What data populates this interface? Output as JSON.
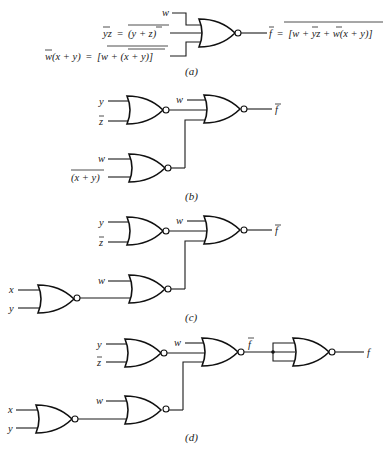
{
  "figure": {
    "panels": [
      {
        "id": "a",
        "caption": "(a)",
        "inputs": [
          {
            "label": "w"
          },
          {
            "label": "y̅z = (y + z̅)",
            "label_left": "yz",
            "label_eq": "=",
            "label_right": "(y + z)"
          },
          {
            "label": "w̅(x + y) = [w + (x + y)]",
            "label_left": "w(x + y)",
            "label_eq": "=",
            "label_right": "[w + (x + y)]"
          }
        ],
        "output": {
          "label": "f̅ = [w + y̅z + w̅(x + y)]",
          "lhs": "f",
          "eq": "=",
          "rhs": "[w + yz + w(x + y)]"
        }
      },
      {
        "id": "b",
        "caption": "(b)",
        "inputs": [
          "y",
          "z",
          "w",
          "w",
          "(x + y)"
        ],
        "output": "f"
      },
      {
        "id": "c",
        "caption": "(c)",
        "inputs": [
          "y",
          "z",
          "w",
          "w",
          "x",
          "y"
        ],
        "output": "f"
      },
      {
        "id": "d",
        "caption": "(d)",
        "inputs": [
          "y",
          "z",
          "w",
          "w",
          "x",
          "y"
        ],
        "intermediate": "f",
        "output": "f"
      }
    ],
    "gate_type": "NOR",
    "colors": {
      "line": "#111111",
      "background": "#ffffff"
    }
  }
}
